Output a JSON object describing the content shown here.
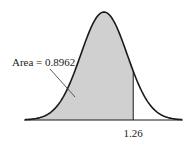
{
  "chart_data": {
    "type": "area",
    "title": "",
    "distribution": "standard normal",
    "shaded_region": {
      "from": "-inf",
      "to": 1.26
    },
    "area_label": "Area = 0.8962",
    "area_value": 0.8962,
    "x_marker": 1.26,
    "x_marker_label": "1.26",
    "xlabel": "",
    "ylabel": "",
    "grid": false,
    "colors": {
      "fill": "#d0d0d0",
      "curve": "#1a1a1a",
      "axis": "#1a1a1a"
    }
  }
}
